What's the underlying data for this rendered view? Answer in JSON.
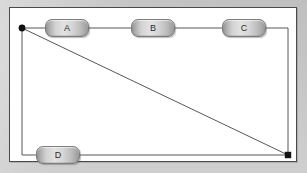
{
  "diagram": {
    "canvas": {
      "background_color": "#ffffff",
      "border_color": "#4a4a4a",
      "page_background_color": "#c9c9c9",
      "width": 288,
      "height": 155
    },
    "nodes": [
      {
        "id": "A",
        "label": "A",
        "x": 35,
        "y": 11,
        "width": 44,
        "height": 18,
        "shape": "rounded-rectangle"
      },
      {
        "id": "B",
        "label": "B",
        "x": 121,
        "y": 11,
        "width": 44,
        "height": 18,
        "shape": "rounded-rectangle"
      },
      {
        "id": "C",
        "label": "C",
        "x": 212,
        "y": 11,
        "width": 44,
        "height": 18,
        "shape": "rounded-rectangle"
      },
      {
        "id": "D",
        "label": "D",
        "x": 26,
        "y": 136,
        "width": 44,
        "height": 18,
        "shape": "rounded-rectangle"
      }
    ],
    "endpoints": [
      {
        "id": "origin",
        "label": "",
        "x": 12,
        "y": 20,
        "shape": "dot",
        "color": "#111111"
      },
      {
        "id": "terminal",
        "label": "",
        "x": 278,
        "y": 147,
        "shape": "dot",
        "color": "#111111"
      }
    ],
    "edges": [
      {
        "id": "origin-to-A",
        "from": "origin",
        "to": "A",
        "style": "straight"
      },
      {
        "id": "A-to-B",
        "from": "A",
        "to": "B",
        "style": "straight"
      },
      {
        "id": "B-to-C",
        "from": "B",
        "to": "C",
        "style": "straight"
      },
      {
        "id": "C-to-terminal",
        "from": "C",
        "to": "terminal",
        "style": "orthogonal"
      },
      {
        "id": "origin-to-D",
        "from": "origin",
        "to": "D",
        "style": "orthogonal"
      },
      {
        "id": "D-to-terminal",
        "from": "D",
        "to": "terminal",
        "style": "straight"
      },
      {
        "id": "origin-to-terminal",
        "from": "origin",
        "to": "terminal",
        "style": "diagonal"
      }
    ],
    "edge_color": "#55575a",
    "edge_width": 1
  }
}
